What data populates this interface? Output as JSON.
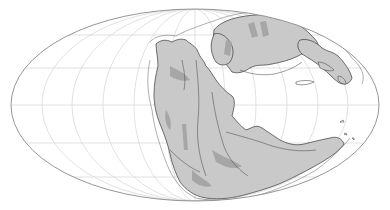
{
  "map": {
    "title": "Paleogeographic reconstruction (Pangaea)",
    "projection": "Mollweide (elliptical)",
    "graticule": {
      "meridian_spacing_deg": 30,
      "parallel_spacing_deg": 30
    },
    "colors": {
      "background": "#ffffff",
      "ocean": "#ffffff",
      "land": "#c9c9c9",
      "land_dark": "#a6a6a6",
      "coast_outline": "#4d4d4d",
      "shelf_outline": "#7a7a7a",
      "graticule": "#d4d4d4",
      "border": "#8a8a8a"
    },
    "features": [
      {
        "name": "pangaea-north-laurasia",
        "label": "Laurasia"
      },
      {
        "name": "pangaea-south-gondwana",
        "label": "Gondwana"
      },
      {
        "name": "east-asian-blocks",
        "label": "East Asian blocks"
      }
    ]
  }
}
